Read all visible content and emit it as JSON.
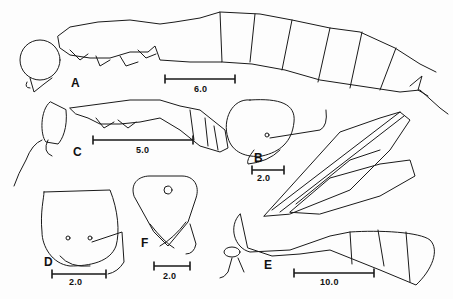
{
  "figure": {
    "panels": [
      {
        "id": "A",
        "label": "A",
        "scale_value": "6.0",
        "description": "lateral view of worker body"
      },
      {
        "id": "B",
        "label": "B",
        "scale_value": "2.0",
        "description": "head in lateral view"
      },
      {
        "id": "C",
        "label": "C",
        "scale_value": "5.0",
        "description": "lateral view of smaller worker"
      },
      {
        "id": "D",
        "label": "D",
        "scale_value": "2.0",
        "description": "head in frontal view"
      },
      {
        "id": "E",
        "label": "E",
        "scale_value": "10.0",
        "description": "winged queen lateral view"
      },
      {
        "id": "F",
        "label": "F",
        "scale_value": "2.0",
        "description": "head of male frontal view"
      }
    ]
  }
}
